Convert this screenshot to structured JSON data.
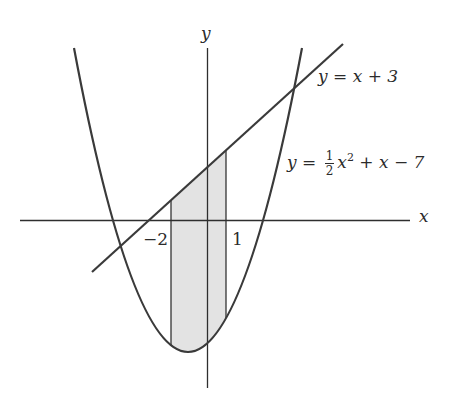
{
  "figure": {
    "axes": {
      "x_label": "x",
      "y_label": "y"
    },
    "tick_labels": {
      "left_bound": "−2",
      "right_bound": "1"
    },
    "line_label": {
      "lhs": "y",
      "eq": "=",
      "rhs": "x + 3"
    },
    "parabola_label": {
      "lhs": "y",
      "eq": "=",
      "frac_num": "1",
      "frac_den": "2",
      "x": "x",
      "exp": "2",
      "rest": "+ x − 7"
    },
    "colors": {
      "stroke": "#3a3a3a",
      "axis": "#2e2e2e",
      "shade": "#e3e3e3",
      "background": "#ffffff"
    },
    "shaded_region": {
      "from_x": -2,
      "to_x": 1,
      "upper_curve": "y = x + 3",
      "lower_curve": "y = 1/2 x^2 + x - 7"
    }
  }
}
